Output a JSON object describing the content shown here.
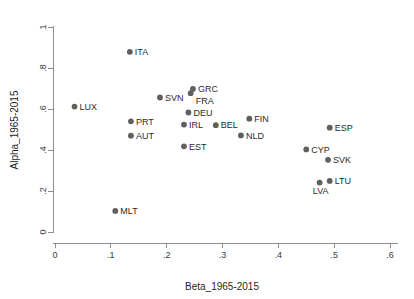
{
  "chart_data": {
    "type": "scatter",
    "title": "",
    "xlabel": "Beta_1965-2015",
    "ylabel": "Alpha_1965-2015",
    "xlim": [
      0,
      0.6
    ],
    "ylim": [
      0,
      1
    ],
    "xticks": [
      0,
      0.1,
      0.2,
      0.3,
      0.4,
      0.5,
      0.6
    ],
    "xticklabels": [
      "0",
      ".1",
      ".2",
      ".3",
      ".4",
      ".5",
      ".6"
    ],
    "yticks": [
      0,
      0.2,
      0.4,
      0.6,
      0.8,
      1
    ],
    "yticklabels": [
      "0",
      ".2",
      ".4",
      ".6",
      ".8",
      "1"
    ],
    "grid": false,
    "legend": "none",
    "marker_color": "#5f5f5f",
    "axis_color": "#8d8d8d",
    "points": [
      {
        "label": "LUX",
        "x": 0.035,
        "y": 0.612,
        "label_pos": "right"
      },
      {
        "label": "ITA",
        "x": 0.134,
        "y": 0.879,
        "label_pos": "right"
      },
      {
        "label": "MLT",
        "x": 0.108,
        "y": 0.103,
        "label_pos": "right"
      },
      {
        "label": "PRT",
        "x": 0.136,
        "y": 0.54,
        "label_pos": "right"
      },
      {
        "label": "AUT",
        "x": 0.136,
        "y": 0.47,
        "label_pos": "right"
      },
      {
        "label": "SVN",
        "x": 0.188,
        "y": 0.656,
        "label_pos": "right"
      },
      {
        "label": "IRL",
        "x": 0.231,
        "y": 0.524,
        "label_pos": "right"
      },
      {
        "label": "EST",
        "x": 0.231,
        "y": 0.418,
        "label_pos": "right"
      },
      {
        "label": "DEU",
        "x": 0.239,
        "y": 0.583,
        "label_pos": "right"
      },
      {
        "label": "GRC",
        "x": 0.247,
        "y": 0.698,
        "label_pos": "right"
      },
      {
        "label": "FRA",
        "x": 0.243,
        "y": 0.677,
        "label_pos": "right-low"
      },
      {
        "label": "BEL",
        "x": 0.288,
        "y": 0.521,
        "label_pos": "right"
      },
      {
        "label": "NLD",
        "x": 0.333,
        "y": 0.471,
        "label_pos": "right"
      },
      {
        "label": "FIN",
        "x": 0.348,
        "y": 0.553,
        "label_pos": "right"
      },
      {
        "label": "CYP",
        "x": 0.45,
        "y": 0.403,
        "label_pos": "right"
      },
      {
        "label": "LVA",
        "x": 0.474,
        "y": 0.241,
        "label_pos": "below"
      },
      {
        "label": "SVK",
        "x": 0.489,
        "y": 0.352,
        "label_pos": "right"
      },
      {
        "label": "LTU",
        "x": 0.492,
        "y": 0.249,
        "label_pos": "right"
      },
      {
        "label": "ESP",
        "x": 0.492,
        "y": 0.509,
        "label_pos": "right"
      }
    ]
  }
}
